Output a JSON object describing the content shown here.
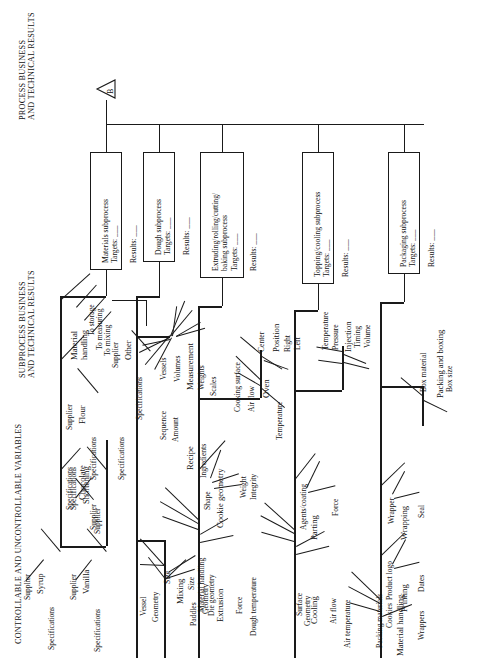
{
  "diagram": {
    "orientation": "rotated-90-ccw",
    "connector_label": "B",
    "headers": [
      {
        "id": "process-header",
        "line1": "PROCESS BUSINESS",
        "line2": "AND TECHNICAL RESULTS"
      },
      {
        "id": "subprocess-header",
        "line1": "SUBPROCESS BUSINESS",
        "line2": "AND TECHNICAL RESULTS"
      },
      {
        "id": "variables-header",
        "line1": "CONTROLLABLE AND UNCONTROLLABLE VARIABLES",
        "line2": ""
      }
    ],
    "target_label": "Targets:  ___",
    "results_label": "Results:  ___",
    "subprocesses": [
      {
        "id": "materials",
        "name": "Materials subprocess",
        "targets": "Targets:  ___",
        "results": "Results:  ___",
        "spine_label": "Specifications",
        "branches": [
          {
            "name": "Syrup",
            "children": [
              "Supplier",
              "Specifications"
            ]
          },
          {
            "name": "Chocolate",
            "children": [
              "Specifications",
              "Supplier"
            ]
          },
          {
            "name": "Flour",
            "children": [
              "Supplier",
              "Specifications"
            ]
          },
          {
            "name": "Vanilla",
            "children": [
              "Supplier",
              "Specifications"
            ]
          },
          {
            "name": "Shortening",
            "children": [
              "Specifications",
              "Supplier"
            ]
          },
          {
            "name": "Other",
            "children": [
              "Supplier",
              "Specifications"
            ]
          },
          {
            "name": "Material handling",
            "children": [
              "To storage",
              "To measuring",
              "To mixing"
            ]
          }
        ]
      },
      {
        "id": "dough",
        "name": "Dough subprocess",
        "targets": "Targets:  ___",
        "results": "Results:  ___",
        "branches": [
          {
            "name": "Measurement",
            "children": [
              "Vessels",
              "Volumes",
              "Weights",
              "Scales"
            ]
          },
          {
            "name": "Recipe",
            "children": [
              "Sequence",
              "Amount",
              "Ingredients"
            ]
          },
          {
            "name": "Mixing",
            "children": [
              "Vessel",
              "Geometry",
              "Size",
              "Paddles",
              "Geometry"
            ]
          }
        ]
      },
      {
        "id": "extruding",
        "name": "Extruding/rolling/cutting/ baking subprocess",
        "name_line1": "Extruding/rolling/cutting/",
        "name_line2": "baking subprocess",
        "targets": "Targets:  ___",
        "results": "Results:  ___",
        "branches": [
          {
            "name": "Position",
            "children": [
              "Center",
              "Right",
              "Left"
            ]
          },
          {
            "name": "Oven",
            "children": [
              "Cooking surface",
              "Air flow",
              "Temperature"
            ]
          },
          {
            "name": "Cookie geometry",
            "children": [
              "Shape",
              "Weight",
              "Integrity"
            ]
          },
          {
            "name": "Extrusion",
            "children": [
              "Material handling",
              "Die geometry",
              "Force",
              "Dough temperature"
            ]
          }
        ]
      },
      {
        "id": "topping",
        "name": "Topping/cooling subprocess",
        "targets": "Targets:  ___",
        "results": "Results:  ___",
        "branches": [
          {
            "name": "Injection",
            "children": [
              "Temperature",
              "Pressure",
              "Timing",
              "Volume"
            ]
          },
          {
            "name": "Parting",
            "children": [
              "Agents/coating",
              "Force"
            ]
          },
          {
            "name": "Cooling",
            "children": [
              "Surface",
              "Geometry",
              "Air flow",
              "Air temperature"
            ]
          }
        ]
      },
      {
        "id": "packaging",
        "name": "Packaging subprocess",
        "targets": "Targets:  ___",
        "results": "Results:  ___",
        "branches": [
          {
            "name": "Packing and boxing",
            "children": [
              "Box material",
              "Box size"
            ]
          },
          {
            "name": "Wrapping",
            "children": [
              "Wrapper",
              "Seal"
            ]
          },
          {
            "name": "Printing",
            "children": [
              "Product logo",
              "Dates"
            ]
          },
          {
            "name": "Material handling",
            "children": [
              "Packing materials",
              "Cookies",
              "Wrappers"
            ]
          }
        ]
      }
    ]
  }
}
